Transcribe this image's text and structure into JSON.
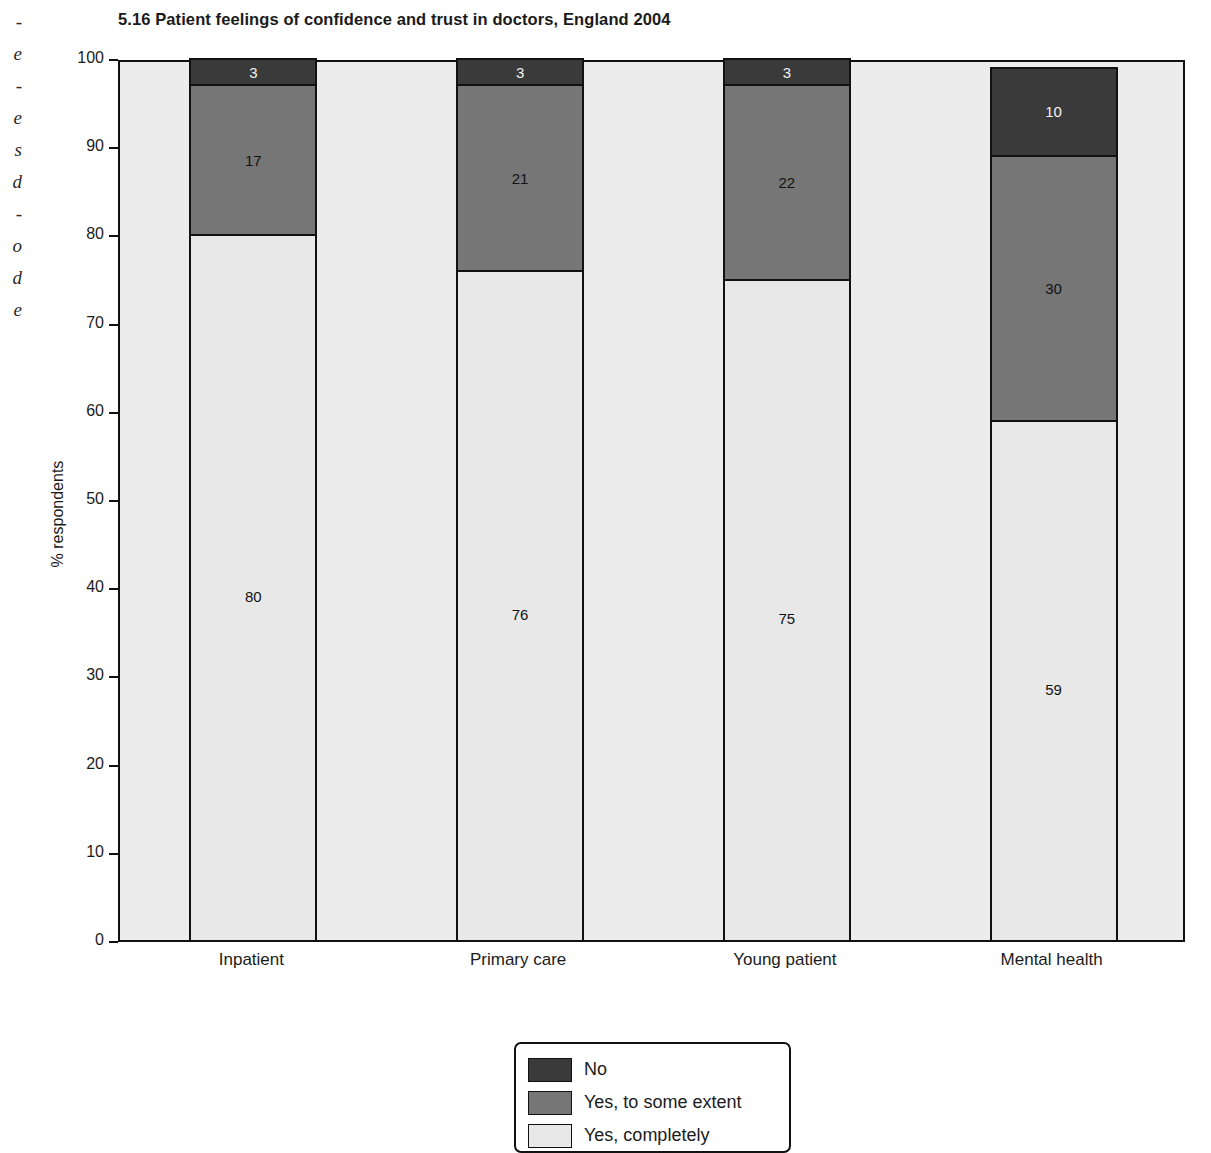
{
  "page_edge_text": "-\ne\n-\ne\ns\nd\n-\no\nd\ne",
  "chart_title": "5.16  Patient feelings of confidence and trust in doctors, England 2004",
  "legend": {
    "items": [
      {
        "label": "No",
        "color": "#3a3a3a"
      },
      {
        "label": "Yes, to some extent",
        "color": "#767676"
      },
      {
        "label": "Yes, completely",
        "color": "#e8e8e8"
      }
    ]
  },
  "colors": {
    "no": "#3a3a3a",
    "some_extent": "#767676",
    "completely": "#e8e8e8",
    "plot_background": "#ececec",
    "axis": "#111111"
  },
  "chart_data": {
    "type": "bar",
    "subtype": "stacked-bar",
    "title": "5.16  Patient feelings of confidence and trust in doctors, England 2004",
    "xlabel": "",
    "ylabel": "% respondents",
    "ylim": [
      0,
      100
    ],
    "yticks": [
      0,
      10,
      20,
      30,
      40,
      50,
      60,
      70,
      80,
      90,
      100
    ],
    "grid": false,
    "legend_position": "bottom-center",
    "categories": [
      "Inpatient",
      "Primary care",
      "Young patient",
      "Mental health"
    ],
    "series": [
      {
        "name": "Yes, completely",
        "values": [
          80,
          76,
          75,
          59
        ],
        "color": "#e8e8e8"
      },
      {
        "name": "Yes, to some extent",
        "values": [
          17,
          21,
          22,
          30
        ],
        "color": "#767676"
      },
      {
        "name": "No",
        "values": [
          3,
          3,
          3,
          10
        ],
        "color": "#3a3a3a"
      }
    ],
    "stack_order_bottom_to_top": [
      "Yes, completely",
      "Yes, to some extent",
      "No"
    ]
  }
}
